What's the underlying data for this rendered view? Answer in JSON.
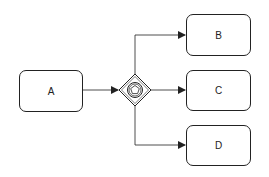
{
  "diagram": {
    "type": "BPMN process",
    "nodes": [
      {
        "id": "A",
        "label": "A"
      },
      {
        "id": "B",
        "label": "B"
      },
      {
        "id": "C",
        "label": "C"
      },
      {
        "id": "D",
        "label": "D"
      }
    ],
    "gateway": {
      "kind": "event-based-gateway",
      "icon": "pentagon-in-double-circle"
    },
    "edges": [
      {
        "from": "A",
        "to": "gateway"
      },
      {
        "from": "gateway",
        "to": "B"
      },
      {
        "from": "gateway",
        "to": "C"
      },
      {
        "from": "gateway",
        "to": "D"
      }
    ],
    "colors": {
      "stroke": "#222222",
      "background": "#ffffff"
    }
  }
}
